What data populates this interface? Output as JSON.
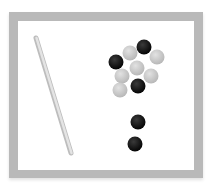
{
  "scene": {
    "description": "Tray with a stick and a cluster of black and gray beads",
    "colors": {
      "frame": "#b9b9b9",
      "background": "#ffffff",
      "stick": "#d4d4d4",
      "stick_edge": "#bdbdbd",
      "bead_black": "#111111",
      "bead_gray": "#c8c8c8"
    },
    "stick": {
      "x1": 36,
      "y1": 38,
      "x2": 71,
      "y2": 153,
      "width": 5
    },
    "beads": [
      {
        "color": "gray",
        "cx": 130,
        "cy": 53
      },
      {
        "color": "black",
        "cx": 144,
        "cy": 47
      },
      {
        "color": "gray",
        "cx": 157,
        "cy": 57
      },
      {
        "color": "black",
        "cx": 116,
        "cy": 62
      },
      {
        "color": "gray",
        "cx": 137,
        "cy": 68
      },
      {
        "color": "gray",
        "cx": 122,
        "cy": 76
      },
      {
        "color": "gray",
        "cx": 151,
        "cy": 76
      },
      {
        "color": "black",
        "cx": 138,
        "cy": 86
      },
      {
        "color": "gray",
        "cx": 120,
        "cy": 90
      },
      {
        "color": "black",
        "cx": 138,
        "cy": 122
      },
      {
        "color": "black",
        "cx": 135,
        "cy": 144
      }
    ],
    "bead_radius": 7.5
  }
}
